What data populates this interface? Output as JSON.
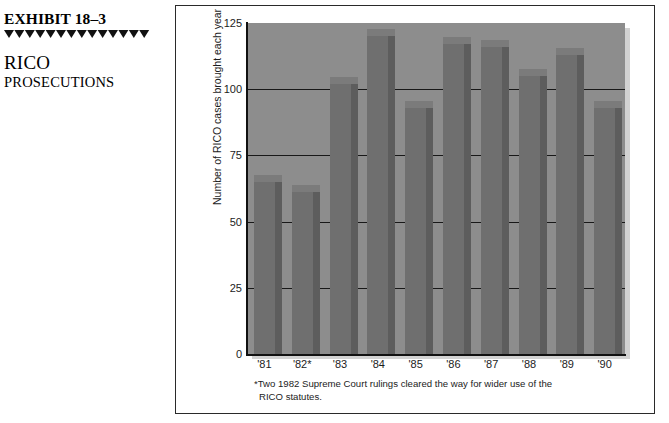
{
  "exhibit": {
    "number": "EXHIBIT 18–3",
    "title_line1": "RICO",
    "title_line2": "PROSECUTIONS",
    "rule_icon": "triangle-rule"
  },
  "chart_data": {
    "type": "bar",
    "title": "",
    "subtitle": "",
    "xlabel": "",
    "ylabel": "Number of RICO cases brought each year",
    "categories": [
      "'81",
      "'82*",
      "'83",
      "'84",
      "'85",
      "'86",
      "'87",
      "'88",
      "'89",
      "'90"
    ],
    "values": [
      65,
      61,
      102,
      120,
      93,
      117,
      116,
      105,
      113,
      93
    ],
    "series": [
      {
        "name": "Number of RICO cases brought each year",
        "values": [
          65,
          61,
          102,
          120,
          93,
          117,
          116,
          105,
          113,
          93
        ]
      }
    ],
    "ylim": [
      0,
      125
    ],
    "yticks": [
      0,
      25,
      50,
      75,
      100,
      125
    ],
    "ytick_labels": [
      "0",
      "25",
      "50",
      "75",
      "100",
      "125"
    ],
    "grid": true,
    "grid_axis": "y",
    "legend": false,
    "legend_position": "none",
    "bar_color": "#6f6f6f",
    "bar_side_color": "#5d5d5d",
    "bar_top_color": "#7b7b7b",
    "plot_background": "#8d8d8d",
    "gridline_color": "#181818",
    "axis_color": "#111111",
    "annotations": [
      {
        "marker": "*",
        "text": "Two 1982 Supreme Court rulings cleared the way for wider use of the RICO statutes.",
        "applies_to": "'82*"
      }
    ]
  },
  "footnote": {
    "line1": "*Two 1982 Supreme Court rulings cleared the way for wider use of the",
    "line2": "RICO statutes."
  }
}
